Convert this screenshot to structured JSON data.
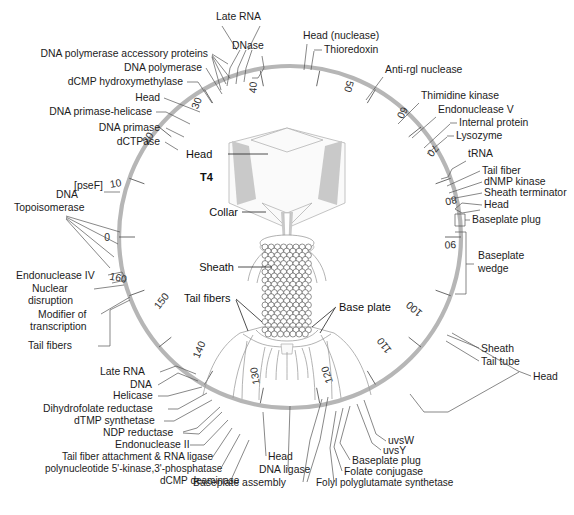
{
  "figure": {
    "center_label": "T4",
    "ring_color": "#b6b6b6",
    "background_color": "#ffffff",
    "map_units_total": 170
  },
  "tick_numbers": [
    "0",
    "10",
    "20",
    "30",
    "40",
    "50",
    "60",
    "70",
    "80",
    "90",
    "100",
    "110",
    "120",
    "130",
    "140",
    "150",
    "160"
  ],
  "inner_labels": [
    {
      "text": "Head",
      "name": "phage-head-label"
    },
    {
      "text": "Collar",
      "name": "phage-collar-label"
    },
    {
      "text": "Sheath",
      "name": "phage-sheath-label"
    },
    {
      "text": "Tail fibers",
      "name": "phage-tail-fibers-label"
    },
    {
      "text": "Base plate",
      "name": "phage-base-plate-label"
    }
  ],
  "gene_labels": {
    "top_left": [
      "DNA polymerase accessory proteins",
      "DNA polymerase",
      "dCMP hydroxymethylase",
      "Head",
      "DNA primase-helicase",
      "DNA primase",
      "dCTPase"
    ],
    "top_center": [
      "Late RNA",
      "DNase",
      "Head (nuclease)",
      "Thioredoxin"
    ],
    "left": [
      "[pseF]",
      "DNA",
      "Topoisomerase",
      "Endonuclease IV",
      "Nuclear",
      "disruption",
      "Modifier of",
      "transcription",
      "Tail fibers"
    ],
    "bottom_left": [
      "Late RNA",
      "DNA",
      "Helicase",
      "Dihydrofolate reductase",
      "dTMP synthetase",
      "NDP reductase",
      "Endonuclease II",
      "Tail fiber attachment & RNA ligase",
      "polynucleotide 5'-kinase,3'-phosphatase",
      "dCMP deaminase"
    ],
    "bottom_center": [
      "Head",
      "DNA ligase",
      "Baseplate assembly"
    ],
    "bottom_right": [
      "uvsW",
      "uvsY",
      "Baseplate plug",
      "Folate conjugase",
      "Folyl polyglutamate synthetase"
    ],
    "right": [
      "Sheath",
      "Tail tube",
      "Head",
      "Baseplate",
      "wedge",
      "Baseplate plug",
      "Head",
      "Sheath terminator",
      "dNMP kinase",
      "Tail fiber",
      "tRNA",
      "Lysozyme",
      "Internal protein",
      "Endonuclease V",
      "Thimidine kinase",
      "Anti-rgl nuclease"
    ]
  }
}
